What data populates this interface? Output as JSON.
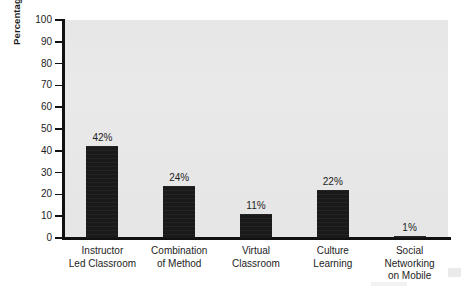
{
  "chart_data": {
    "type": "bar",
    "title": "",
    "subtitle": "",
    "xlabel": "",
    "ylabel": "Percentage Using",
    "categories": [
      "Instructor Led Classroom",
      "Combination of Method",
      "Virtual Classroom",
      "Culture Learning",
      "Social Networking on Mobile"
    ],
    "category_lines": [
      [
        "Instructor",
        "Led Classroom"
      ],
      [
        "Combination",
        "of Method"
      ],
      [
        "Virtual",
        "Classroom"
      ],
      [
        "Culture",
        "Learning"
      ],
      [
        "Social",
        "Networking",
        "on Mobile"
      ]
    ],
    "values": [
      42,
      24,
      11,
      22,
      1
    ],
    "data_labels": [
      "42%",
      "24%",
      "11%",
      "22%",
      "1%"
    ],
    "ylim": [
      0,
      100
    ],
    "ytick_values": [
      0,
      10,
      20,
      30,
      40,
      50,
      60,
      70,
      80,
      90,
      100
    ],
    "ytick_labels": [
      "0",
      "10",
      "20",
      "30",
      "40",
      "50",
      "60",
      "70",
      "80",
      "90",
      "100"
    ],
    "grid": false,
    "legend": false,
    "legend_position": "none",
    "bar_color": "#1a1a1a",
    "plot_background": "#e9e9e9",
    "figure_background": "#ffffff",
    "axis_color": "#111111",
    "text_color": "#1d1d1d"
  }
}
